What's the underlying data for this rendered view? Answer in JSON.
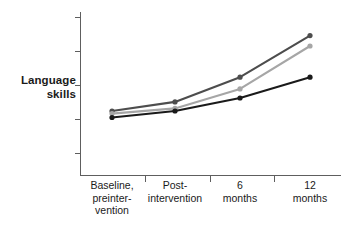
{
  "chart_data": {
    "type": "line",
    "title": "",
    "subtitle": "",
    "xlabel": "",
    "ylabel": "Language skills",
    "ylabel_lines": [
      "Language",
      "skills"
    ],
    "categories": [
      "Baseline, preintervention",
      "Post-intervention",
      "6 months",
      "12 months"
    ],
    "category_lines": [
      [
        "Baseline,",
        "preinter-",
        "vention"
      ],
      [
        "Post-",
        "intervention"
      ],
      [
        "6",
        "months"
      ],
      [
        "12",
        "months"
      ]
    ],
    "grid": false,
    "legend": "none",
    "y_axis_tick_labels": [],
    "y_axis_tick_count": 5,
    "ylim": [
      0,
      100
    ],
    "xlim": [
      0,
      3
    ],
    "series": [
      {
        "name": "series-1-dark-gray",
        "color": "#4d4d4d",
        "values": [
          30,
          37,
          56,
          88
        ]
      },
      {
        "name": "series-2-light-gray",
        "color": "#a6a6a6",
        "values": [
          28,
          32,
          47,
          80
        ]
      },
      {
        "name": "series-3-black",
        "color": "#1a1a1a",
        "values": [
          25,
          30,
          40,
          56
        ]
      }
    ]
  },
  "axes": {
    "axis_color": "#5e5e5e",
    "y_axis_name": "y-axis",
    "x_axis_name": "x-axis"
  },
  "colors": {
    "background": "#ffffff",
    "text": "#1a1a1a",
    "axis": "#5e5e5e",
    "series_dark_gray": "#4d4d4d",
    "series_light_gray": "#a6a6a6",
    "series_black": "#1a1a1a"
  }
}
